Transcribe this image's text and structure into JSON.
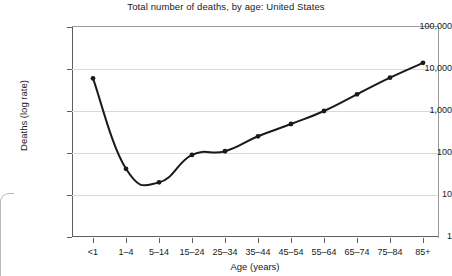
{
  "chart_data": {
    "type": "line",
    "title": "Total number of deaths, by age: United States",
    "xlabel": "Age (years)",
    "ylabel": "Deaths (log rate)",
    "yscale": "log",
    "ylim": [
      1,
      100000
    ],
    "grid": true,
    "legend": false,
    "categories": [
      "<1",
      "1–4",
      "5–14",
      "15–24",
      "25–34",
      "35–44",
      "45–54",
      "55–64",
      "65–74",
      "75–84",
      "85+"
    ],
    "values": [
      6000,
      42,
      20,
      90,
      110,
      250,
      490,
      1000,
      2500,
      6200,
      14000
    ],
    "ytick_labels": [
      "100,000",
      "10,000",
      "1,000",
      "100",
      "10",
      "1"
    ],
    "ytick_values": [
      100000,
      10000,
      1000,
      100,
      10,
      1
    ],
    "series": [
      {
        "name": "Deaths",
        "values": [
          6000,
          42,
          20,
          90,
          110,
          250,
          490,
          1000,
          2500,
          6200,
          14000
        ],
        "color": "#1a1a1a",
        "marker": "circle"
      }
    ]
  },
  "axes": {
    "y_title": "Deaths (log rate)",
    "x_title": "Age (years)"
  },
  "colors": {
    "line": "#1a1a1a",
    "grid": "#d9d9d9",
    "axis": "#5e5e5e",
    "frame": "#9a9a9a",
    "text": "#1a1a1a",
    "background": "#ffffff"
  }
}
